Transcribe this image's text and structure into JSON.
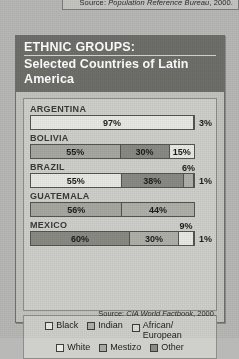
{
  "top_box": {
    "source_prefix": "Source: ",
    "source_italic": "Population Reference Bureau",
    "source_suffix": ", 2000."
  },
  "panel": {
    "title_line1": "ETHNIC GROUPS:",
    "title_line2": "Selected Countries of Latin America",
    "source_prefix": "Source: ",
    "source_italic": "CIA World Factbook",
    "source_suffix": ", 2000."
  },
  "legend": {
    "row1": [
      {
        "label": "Black",
        "shade": "#e9e9e6"
      },
      {
        "label": "Indian",
        "shade": "#b0b0ab"
      },
      {
        "label": "African/ European",
        "shade": "#dcdcd8"
      }
    ],
    "row2": [
      {
        "label": "White",
        "shade": "#e9e9e6"
      },
      {
        "label": "Mestizo",
        "shade": "#a8a8a3"
      },
      {
        "label": "Other",
        "shade": "#8a8a85"
      }
    ]
  },
  "chart_data": {
    "type": "bar",
    "title": "ETHNIC GROUPS: Selected Countries of Latin America",
    "subtype": "stacked-horizontal-100",
    "xlabel": "",
    "ylabel": "",
    "xlim": [
      0,
      100
    ],
    "grid": false,
    "legend_position": "bottom",
    "categories": [
      "ARGENTINA",
      "BOLIVIA",
      "BRAZIL",
      "GUATEMALA",
      "MEXICO"
    ],
    "series": [
      {
        "name": "White",
        "values": [
          97,
          55,
          55,
          0,
          0
        ]
      },
      {
        "name": "Mestizo",
        "values": [
          0,
          30,
          0,
          56,
          60
        ]
      },
      {
        "name": "Indian",
        "values": [
          0,
          15,
          0,
          44,
          30
        ]
      },
      {
        "name": "Black",
        "values": [
          0,
          0,
          6,
          0,
          9
        ]
      },
      {
        "name": "African/European",
        "values": [
          0,
          0,
          38,
          0,
          0
        ]
      },
      {
        "name": "Other",
        "values": [
          3,
          0,
          1,
          0,
          1
        ]
      }
    ],
    "rows": [
      {
        "country": "ARGENTINA",
        "segments": [
          {
            "label": "97%",
            "value": 97,
            "group": "White",
            "shade": "#e9e9e6",
            "placement": "inside"
          },
          {
            "label": "3%",
            "value": 3,
            "group": "Other",
            "shade": "#4f4f4b",
            "placement": "right"
          }
        ]
      },
      {
        "country": "BOLIVIA",
        "segments": [
          {
            "label": "55%",
            "value": 55,
            "group": "White",
            "shade": "#a8a8a3",
            "placement": "inside"
          },
          {
            "label": "30%",
            "value": 30,
            "group": "Mestizo",
            "shade": "#8a8a85",
            "placement": "inside"
          },
          {
            "label": "15%",
            "value": 15,
            "group": "Indian",
            "shade": "#e9e9e6",
            "placement": "inside"
          }
        ]
      },
      {
        "country": "BRAZIL",
        "segments": [
          {
            "label": "55%",
            "value": 55,
            "group": "White",
            "shade": "#e9e9e6",
            "placement": "inside"
          },
          {
            "label": "38%",
            "value": 38,
            "group": "African/European",
            "shade": "#8a8a85",
            "placement": "inside"
          },
          {
            "label": "6%",
            "value": 6,
            "group": "Black",
            "shade": "#b0b0ab",
            "placement": "top"
          },
          {
            "label": "1%",
            "value": 1,
            "group": "Other",
            "shade": "#e9e9e6",
            "placement": "right"
          }
        ]
      },
      {
        "country": "GUATEMALA",
        "segments": [
          {
            "label": "56%",
            "value": 56,
            "group": "Mestizo",
            "shade": "#a8a8a3",
            "placement": "inside"
          },
          {
            "label": "44%",
            "value": 44,
            "group": "Indian",
            "shade": "#b0b0ab",
            "placement": "inside"
          }
        ]
      },
      {
        "country": "MEXICO",
        "segments": [
          {
            "label": "60%",
            "value": 60,
            "group": "Mestizo",
            "shade": "#8a8a85",
            "placement": "inside"
          },
          {
            "label": "30%",
            "value": 30,
            "group": "Indian",
            "shade": "#b0b0ab",
            "placement": "inside"
          },
          {
            "label": "9%",
            "value": 9,
            "group": "Black",
            "shade": "#e9e9e6",
            "placement": "top"
          },
          {
            "label": "1%",
            "value": 1,
            "group": "Other",
            "shade": "#e9e9e6",
            "placement": "right"
          }
        ]
      }
    ]
  }
}
